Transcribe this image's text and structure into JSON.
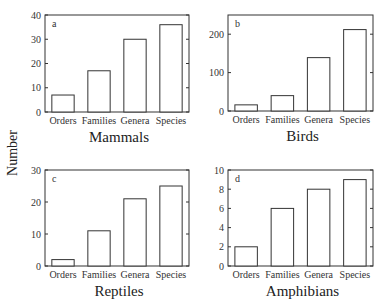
{
  "chart_data": [
    {
      "type": "bar",
      "panel": "a",
      "title": "Mammals",
      "xlabel": "Mammals",
      "ylabel": "Number",
      "categories": [
        "Orders",
        "Families",
        "Genera",
        "Species"
      ],
      "values": [
        7,
        17,
        30,
        36
      ],
      "ylim": [
        0,
        40
      ],
      "yticks": [
        0,
        10,
        20,
        30,
        40
      ],
      "grid": false
    },
    {
      "type": "bar",
      "panel": "b",
      "title": "Birds",
      "xlabel": "Birds",
      "ylabel": "Number",
      "categories": [
        "Orders",
        "Families",
        "Genera",
        "Species"
      ],
      "values": [
        16,
        40,
        139,
        212
      ],
      "ylim": [
        0,
        250
      ],
      "yticks": [
        0,
        100,
        200
      ],
      "grid": false
    },
    {
      "type": "bar",
      "panel": "c",
      "title": "Reptiles",
      "xlabel": "Reptiles",
      "ylabel": "Number",
      "categories": [
        "Orders",
        "Families",
        "Genera",
        "Species"
      ],
      "values": [
        2,
        11,
        21,
        25
      ],
      "ylim": [
        0,
        30
      ],
      "yticks": [
        0,
        10,
        20,
        30
      ],
      "grid": false
    },
    {
      "type": "bar",
      "panel": "d",
      "title": "Amphibians",
      "xlabel": "Amphibians",
      "ylabel": "Number",
      "categories": [
        "Orders",
        "Families",
        "Genera",
        "Species"
      ],
      "values": [
        2,
        6,
        8,
        9
      ],
      "ylim": [
        0,
        10
      ],
      "yticks": [
        0,
        2,
        4,
        6,
        8,
        10
      ],
      "grid": false
    }
  ],
  "shared_ylabel": "Number",
  "colors": {
    "bar_fill": "#ffffff",
    "bar_stroke": "#333333",
    "axis": "#333333"
  }
}
